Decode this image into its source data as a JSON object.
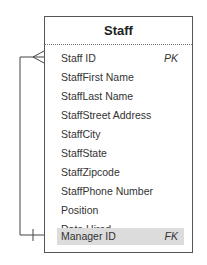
{
  "entity": {
    "title": "Staff",
    "attributes": [
      {
        "name": "Staff ID",
        "key": "PK",
        "highlight": false
      },
      {
        "name": "StaffFirst Name",
        "key": "",
        "highlight": false
      },
      {
        "name": "StaffLast Name",
        "key": "",
        "highlight": false
      },
      {
        "name": "StaffStreet Address",
        "key": "",
        "highlight": false
      },
      {
        "name": "StaffCity",
        "key": "",
        "highlight": false
      },
      {
        "name": "StaffState",
        "key": "",
        "highlight": false
      },
      {
        "name": "StaffZipcode",
        "key": "",
        "highlight": false
      },
      {
        "name": "StaffPhone Number",
        "key": "",
        "highlight": false
      },
      {
        "name": "Position",
        "key": "",
        "highlight": false
      },
      {
        "name": "Date Hired",
        "key": "",
        "highlight": false
      },
      {
        "name": "Manager ID",
        "key": "FK",
        "highlight": true
      }
    ]
  },
  "relationship": {
    "from": "Manager ID",
    "to": "Staff ID",
    "from_symbol": "one",
    "to_symbol": "many"
  }
}
